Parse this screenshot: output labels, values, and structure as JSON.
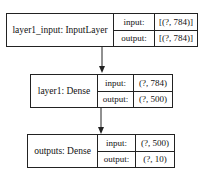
{
  "diagram": {
    "type": "keras-model-plot",
    "nodes": [
      {
        "id": "layer1_input",
        "label": "layer1_input: InputLayer",
        "input_label": "input:",
        "input_shape": "[(?, 784)]",
        "output_label": "output:",
        "output_shape": "[(?, 784)]"
      },
      {
        "id": "layer1",
        "label": "layer1: Dense",
        "input_label": "input:",
        "input_shape": "(?, 784)",
        "output_label": "output:",
        "output_shape": "(?, 500)"
      },
      {
        "id": "outputs",
        "label": "outputs: Dense",
        "input_label": "input:",
        "input_shape": "(?, 500)",
        "output_label": "output:",
        "output_shape": "(?, 10)"
      }
    ],
    "edges": [
      {
        "from": "layer1_input",
        "to": "layer1"
      },
      {
        "from": "layer1",
        "to": "outputs"
      }
    ],
    "colors": {
      "line": "#222222",
      "background": "#ffffff"
    }
  }
}
